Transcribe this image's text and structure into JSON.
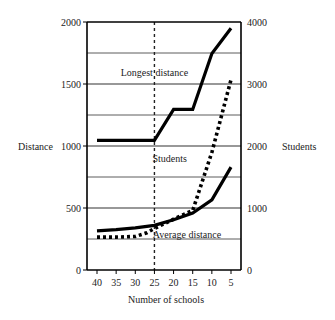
{
  "chart_data": {
    "type": "line",
    "title": "",
    "xlabel": "Number of schools",
    "ylabel": "Distance",
    "y2label": "Students",
    "x": [
      40,
      35,
      30,
      25,
      20,
      15,
      10,
      5
    ],
    "xlim": [
      40,
      5
    ],
    "x_reversed": true,
    "ylim": [
      0,
      2000
    ],
    "y2lim": [
      0,
      4000
    ],
    "x_ticks": [
      "40",
      "35",
      "30",
      "25",
      "20",
      "15",
      "10",
      "5"
    ],
    "y_ticks": [
      "0",
      "500",
      "1000",
      "1500",
      "2000"
    ],
    "y_tick_values": [
      0,
      500,
      1000,
      1500,
      2000
    ],
    "y2_ticks": [
      "0",
      "1000",
      "2000",
      "3000",
      "4000"
    ],
    "y2_tick_values": [
      0,
      1000,
      2000,
      3000,
      4000
    ],
    "gridlines_y": [
      250,
      500,
      750,
      1000,
      1250,
      1500,
      1750
    ],
    "grid": true,
    "reference_line": {
      "x": 25,
      "style": "dashed"
    },
    "series": [
      {
        "name": "Longest distance",
        "axis": "left",
        "style": "solid-thick",
        "x": [
          40,
          35,
          30,
          25,
          20,
          15,
          10,
          5
        ],
        "values": [
          1045,
          1045,
          1045,
          1045,
          1295,
          1295,
          1745,
          1950
        ]
      },
      {
        "name": "Students",
        "axis": "right",
        "style": "dotted-thick",
        "x": [
          40,
          35,
          30,
          27,
          25,
          20,
          15,
          10,
          5
        ],
        "values": [
          530,
          530,
          540,
          600,
          670,
          820,
          960,
          1900,
          3070
        ]
      },
      {
        "name": "Average distance",
        "axis": "left",
        "style": "solid-thick",
        "x": [
          40,
          35,
          30,
          25,
          20,
          15,
          10,
          5
        ],
        "values": [
          315,
          325,
          340,
          360,
          405,
          460,
          565,
          830
        ]
      }
    ],
    "annotations": [
      {
        "text": "Longest distance",
        "x": 25,
        "y": 1590,
        "axis": "left"
      },
      {
        "text": "Students",
        "x": 21,
        "y": 900,
        "axis": "left"
      },
      {
        "text": "Average distance",
        "x": 16.5,
        "y": 285,
        "axis": "left"
      }
    ]
  }
}
